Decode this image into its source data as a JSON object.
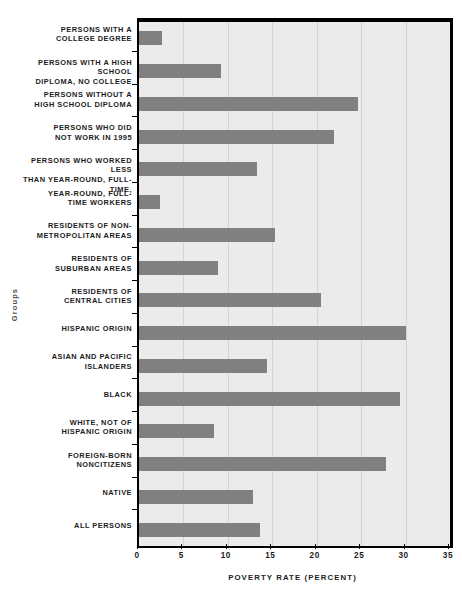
{
  "chart_data": {
    "type": "bar",
    "orientation": "horizontal",
    "title": "",
    "xlabel": "Poverty Rate (Percent)",
    "ylabel": "Groups",
    "xlim": [
      0,
      35
    ],
    "xticks": [
      0,
      5,
      10,
      15,
      20,
      25,
      30,
      35
    ],
    "xtick_labels": [
      "0",
      "5",
      "10",
      "15",
      "20",
      "25",
      "30",
      "35"
    ],
    "grid": true,
    "grid_axis": "x",
    "legend": false,
    "bar_color": "#808080",
    "plot_background": "#ebebeb",
    "axis_color": "#000000",
    "categories": [
      "Persons with a college degree",
      "Persons with a high school diploma, no college",
      "Persons without a high school diploma",
      "Persons who did not work in 1995",
      "Persons who worked less than year-round, full-time,",
      "Year-round, full-time workers",
      "Residents of non-metropolitan areas",
      "Residents of suburban areas",
      "Residents of central cities",
      "Hispanic Origin",
      "Asian and Pacific Islanders",
      "Black",
      "White, not of Hispanic origin",
      "Foreign-born noncitizens",
      "Native",
      "All persons"
    ],
    "category_lines": [
      [
        "Persons with a",
        "college degree"
      ],
      [
        "Persons with a high school",
        "diploma, no college"
      ],
      [
        "Persons without a",
        "high school diploma"
      ],
      [
        "Persons who did",
        "not work in 1995"
      ],
      [
        "Persons who worked less",
        "than year-round, full-time,"
      ],
      [
        "Year-round, full-",
        "time workers"
      ],
      [
        "Residents of non-",
        "metropolitan areas"
      ],
      [
        "Residents of",
        "suburban areas"
      ],
      [
        "Residents of",
        "central cities"
      ],
      [
        "Hispanic Origin"
      ],
      [
        "Asian and Pacific",
        "Islanders"
      ],
      [
        "Black"
      ],
      [
        "White, not of",
        "Hispanic origin"
      ],
      [
        "Foreign-born",
        "noncitizens"
      ],
      [
        "Native"
      ],
      [
        "All persons"
      ]
    ],
    "values": [
      2.6,
      9.2,
      24.6,
      22.0,
      13.3,
      2.4,
      15.3,
      8.9,
      20.5,
      30.0,
      14.4,
      29.4,
      8.4,
      27.8,
      12.8,
      13.6
    ]
  }
}
